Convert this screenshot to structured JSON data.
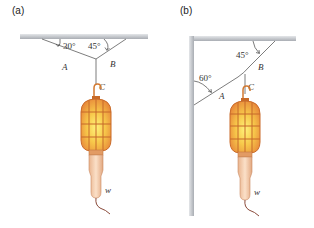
{
  "panels": [
    {
      "id": "a",
      "label": "(a)",
      "angles": {
        "A": "30°",
        "B": "45°"
      },
      "ropes": {
        "A": "A",
        "B": "B",
        "C": "C"
      },
      "weight": "w",
      "support": "ceiling"
    },
    {
      "id": "b",
      "label": "(b)",
      "angles": {
        "A": "60°",
        "B": "45°"
      },
      "ropes": {
        "A": "A",
        "B": "B",
        "C": "C"
      },
      "weight": "w",
      "support": "ceiling and wall"
    }
  ],
  "colors": {
    "support": "#c8cbd0",
    "rope": "#6e6e6e",
    "lamp_cage": "#e58a3c",
    "lamp_glow": "#f6d24a",
    "handle": "#f3c9a6",
    "cord": "#8a4a3a"
  }
}
